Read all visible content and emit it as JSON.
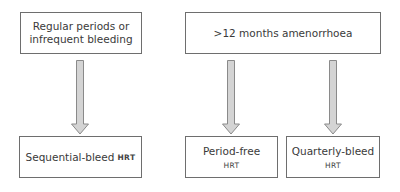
{
  "diagram": {
    "type": "flowchart",
    "top_boxes": [
      {
        "id": "regular",
        "line1": "Regular periods or",
        "line2": "infrequent bleeding"
      },
      {
        "id": "amenorrhoea",
        "text": ">12 months amenorrhoea"
      }
    ],
    "bottom_boxes": [
      {
        "id": "sequential",
        "text": "Sequential-bleed",
        "suffix": "HRT"
      },
      {
        "id": "period_free",
        "text": "Period-free",
        "suffix": "HRT"
      },
      {
        "id": "quarterly",
        "text": "Quarterly-bleed",
        "suffix": "HRT"
      }
    ],
    "edges": [
      {
        "from": "regular",
        "to": "sequential"
      },
      {
        "from": "amenorrhoea",
        "to": "period_free"
      },
      {
        "from": "amenorrhoea",
        "to": "quarterly"
      }
    ],
    "colors": {
      "border": "#6e6e6e",
      "arrow_fill": "#d4d4d4",
      "arrow_stroke": "#8a8a8a"
    }
  }
}
